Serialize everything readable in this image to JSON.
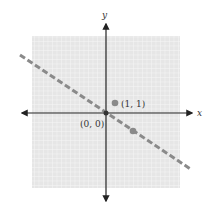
{
  "diagram": {
    "type": "coordinate-plane",
    "axes": {
      "x_label": "x",
      "y_label": "y"
    },
    "grid": {
      "x_min": -8,
      "x_max": 8,
      "y_min": -8,
      "y_max": 8,
      "unit_px": 9
    },
    "line": {
      "style": "dashed",
      "equation": "y = -2/3 x",
      "slope": -0.6667,
      "intercept": 0,
      "color": "#8a8a8a"
    },
    "points": [
      {
        "label": "(1, 1)",
        "x": 1,
        "y": 1,
        "color": "#8a8a8a"
      },
      {
        "label": "(0, 0)",
        "x": 0,
        "y": 0,
        "color": "#333333"
      },
      {
        "label": "",
        "x": 3,
        "y": -2,
        "color": "#8a8a8a"
      }
    ],
    "colors": {
      "grid_bg": "#e6e6e6",
      "grid_line": "#f7f7f7",
      "axis": "#222222"
    }
  }
}
